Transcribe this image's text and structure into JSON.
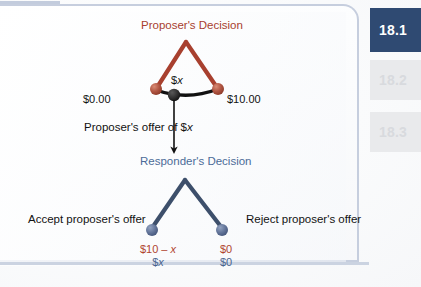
{
  "figure": {
    "proposer_title": "Proposer's Decision",
    "responder_title": "Responder's Decision",
    "proposer_left_payoff": "$0.00",
    "proposer_right_payoff": "$10.00",
    "offer_node_label": "$x",
    "offer_arrow_label": "Proposer's offer of $x",
    "accept_label": "Accept proposer's offer",
    "reject_label": "Reject proposer's offer",
    "accept_payoff_top": "$10 – x",
    "accept_payoff_bottom": "$x",
    "reject_payoff_top": "$0",
    "reject_payoff_bottom": "$0"
  },
  "colors": {
    "proposer_red": "#a8402f",
    "proposer_node": "#b05542",
    "responder_blue": "#4c6b98",
    "responder_node": "#64769b",
    "responder_branch": "#3d4f6b",
    "offer_line": "#111111",
    "active_tab_bg": "#2f4a72",
    "inactive_tab_bg": "#e9eaec",
    "panel_border": "#c6cede"
  },
  "tabs": [
    {
      "label": "18.1",
      "state": "active"
    },
    {
      "label": "18.2",
      "state": "inactive"
    },
    {
      "label": "18.3",
      "state": "inactive"
    }
  ]
}
